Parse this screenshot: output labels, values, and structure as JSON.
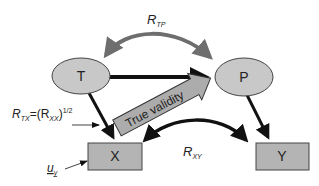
{
  "diagram": {
    "nodes": {
      "T": {
        "label": "T",
        "shape": "ellipse"
      },
      "P": {
        "label": "P",
        "shape": "ellipse"
      },
      "X": {
        "label": "X",
        "shape": "box"
      },
      "Y": {
        "label": "Y",
        "shape": "box"
      }
    },
    "labels": {
      "r_tp_main": "R",
      "r_tp_sub": "TP",
      "r_xy_main": "R",
      "r_xy_sub": "XY",
      "r_tx_main": "R",
      "r_tx_sub": "TX",
      "r_tx_eq": "=(R",
      "r_xx_sub": "XX",
      "r_tx_close": ")",
      "r_tx_exp": "1/2",
      "u_main": "u",
      "u_sub": "y",
      "true_validity": "True validity"
    },
    "edges": [
      {
        "from": "T",
        "to": "P",
        "style": "thick-black",
        "type": "directed"
      },
      {
        "from": "T",
        "to": "X",
        "style": "black",
        "type": "directed"
      },
      {
        "from": "P",
        "to": "Y",
        "style": "black",
        "type": "directed"
      },
      {
        "from": "T",
        "to": "P",
        "style": "gray-curved",
        "type": "bidirectional",
        "label": "R_TP"
      },
      {
        "from": "X",
        "to": "Y",
        "style": "black-curved",
        "type": "bidirectional",
        "label": "R_XY"
      },
      {
        "from": "X",
        "to": "P",
        "style": "block-arrow",
        "label": "True validity"
      }
    ],
    "colors": {
      "node_fill": "#c8c8c8",
      "box_fill": "#b4b4b4",
      "arc_gray": "#6e6e6e",
      "block_fill": "#acacac",
      "stroke": "#111111"
    }
  }
}
